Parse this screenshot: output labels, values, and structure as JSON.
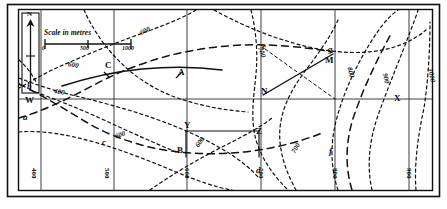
{
  "figure": {
    "type": "contour-map",
    "scale_bar": {
      "caption": "Scale in metres",
      "ticks": [
        "0",
        "500",
        "1000"
      ]
    },
    "north_arrow": {
      "label": "N"
    },
    "points": [
      {
        "id": "A",
        "label": "A",
        "x": 178,
        "y": 74
      },
      {
        "id": "B",
        "label": "B",
        "x": 177,
        "y": 152
      },
      {
        "id": "C",
        "label": "C",
        "x": 107,
        "y": 68
      },
      {
        "id": "W",
        "label": "W",
        "x": 30,
        "y": 101
      },
      {
        "id": "X",
        "label": "X",
        "x": 397,
        "y": 99
      },
      {
        "id": "Y",
        "label": "Y",
        "x": 185,
        "y": 127
      },
      {
        "id": "Z",
        "label": "Z",
        "x": 259,
        "y": 133
      },
      {
        "id": "M",
        "label": "M",
        "x": 327,
        "y": 61
      },
      {
        "id": "N",
        "label": "N",
        "x": 263,
        "y": 92
      },
      {
        "id": "a",
        "label": "a",
        "x": 25,
        "y": 118
      },
      {
        "id": "b",
        "label": "b",
        "x": 29,
        "y": 87
      },
      {
        "id": "c",
        "label": "c",
        "x": 104,
        "y": 143
      },
      {
        "id": "d",
        "label": "d",
        "x": 258,
        "y": 172
      },
      {
        "id": "e",
        "label": "e",
        "x": 264,
        "y": 47
      },
      {
        "id": "f",
        "label": "f",
        "x": 331,
        "y": 152
      },
      {
        "id": "g",
        "label": "g",
        "x": 330,
        "y": 50
      }
    ],
    "contour_labels": [
      {
        "value": "600",
        "x": 140,
        "y": 31,
        "rot": -25
      },
      {
        "value": "600",
        "x": 70,
        "y": 66,
        "rot": 12
      },
      {
        "value": "400",
        "x": 56,
        "y": 92,
        "rot": 10
      },
      {
        "value": "700",
        "x": 258,
        "y": 52,
        "rot": 70
      },
      {
        "value": "600",
        "x": 117,
        "y": 135,
        "rot": -22
      },
      {
        "value": "600",
        "x": 197,
        "y": 142,
        "rot": -55
      },
      {
        "value": "700",
        "x": 293,
        "y": 148,
        "rot": -60
      },
      {
        "value": "800",
        "x": 347,
        "y": 72,
        "rot": 75
      },
      {
        "value": "900",
        "x": 382,
        "y": 78,
        "rot": 78
      },
      {
        "value": "1000",
        "x": 426,
        "y": 76,
        "rot": 80
      }
    ],
    "bottom_axis_labels": [
      {
        "value": "400",
        "x": 35,
        "y": 172
      },
      {
        "value": "500",
        "x": 108,
        "y": 172
      },
      {
        "value": "600",
        "x": 188,
        "y": 172
      },
      {
        "value": "700",
        "x": 262,
        "y": 172
      },
      {
        "value": "800",
        "x": 337,
        "y": 172
      },
      {
        "value": "900",
        "x": 410,
        "y": 172
      }
    ],
    "frame": {
      "x": 18,
      "y": 9,
      "width": 415,
      "height": 182
    },
    "colors": {
      "ink": "#101010",
      "paper": "#fefefe"
    }
  }
}
